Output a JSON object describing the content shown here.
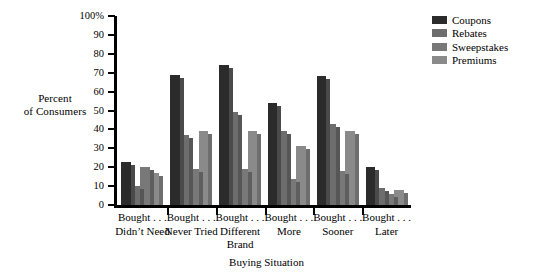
{
  "chart_data": {
    "type": "bar",
    "title": "",
    "xlabel": "Buying Situation",
    "ylabel": "Percent\nof Consumers",
    "ylabel_line1": "Percent",
    "ylabel_line2": "of Consumers",
    "ylim": [
      0,
      100
    ],
    "ytick_values": [
      0,
      10,
      20,
      30,
      40,
      50,
      60,
      70,
      80,
      90,
      100
    ],
    "ytick_labels": [
      "0",
      "10",
      "20",
      "30",
      "40",
      "50",
      "60",
      "70",
      "80",
      "90",
      "100%"
    ],
    "grid": false,
    "legend_position": "top-right",
    "categories": [
      "Bought . . .\nDidn't Need",
      "Bought . . .\nNever Tried",
      "Bought . . .\nDifferent\nBrand",
      "Bought . . .\nMore",
      "Bought . . .\nSooner",
      "Bought . . .\nLater"
    ],
    "category_lines": [
      [
        "Bought . . .",
        "Didn’t Need"
      ],
      [
        "Bought . . .",
        "Never Tried"
      ],
      [
        "Bought . . .",
        "Different",
        "Brand"
      ],
      [
        "Bought . . .",
        "More"
      ],
      [
        "Bought . . .",
        "Sooner"
      ],
      [
        "Bought . . .",
        "Later"
      ]
    ],
    "series": [
      {
        "name": "Coupons",
        "color": "#2b2b2b",
        "side_color": "#4a4a4a",
        "values": [
          23,
          69,
          74,
          54,
          68,
          20
        ]
      },
      {
        "name": "Rebates",
        "color": "#6d6d6d",
        "side_color": "#565656",
        "values": [
          10,
          37,
          49,
          39,
          43,
          9
        ]
      },
      {
        "name": "Sweepstakes",
        "color": "#787878",
        "side_color": "#5e5e5e",
        "values": [
          20,
          19,
          19,
          14,
          18,
          6
        ]
      },
      {
        "name": "Premiums",
        "color": "#8a8a8a",
        "side_color": "#6e6e6e",
        "values": [
          17,
          39,
          39,
          31,
          39,
          8
        ]
      }
    ]
  },
  "legend": {
    "entries": [
      {
        "label": "Coupons"
      },
      {
        "label": "Rebates"
      },
      {
        "label": "Sweepstakes"
      },
      {
        "label": "Premiums"
      }
    ]
  }
}
